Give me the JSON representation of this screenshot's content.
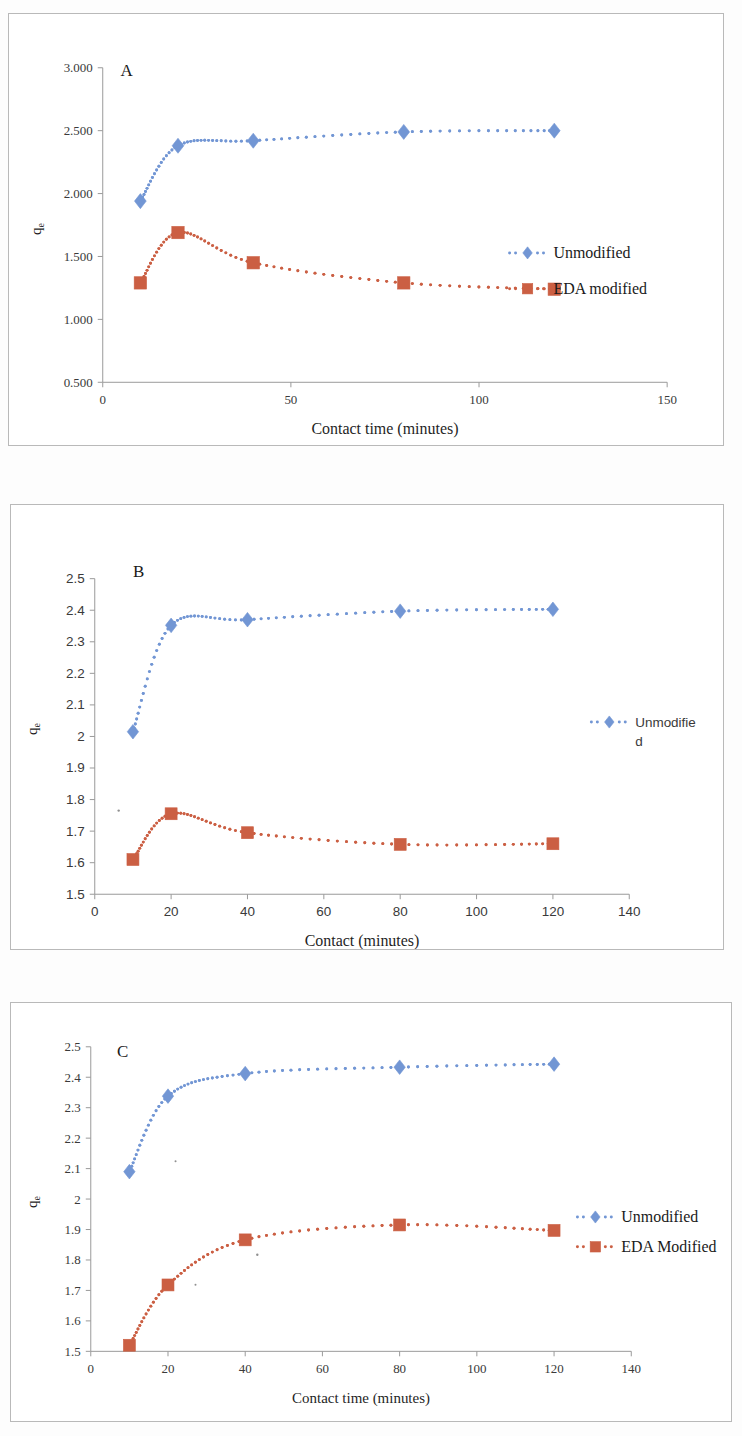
{
  "figure": {
    "background": "#ffffff",
    "series_colors": {
      "unmodified": "#7296d4",
      "eda": "#cb5f43"
    }
  },
  "panels": [
    {
      "id": "A",
      "letter": "A",
      "xlabel": "Contact time (minutes)",
      "ylabel_base": "q",
      "ylabel_sub": "e",
      "legend": [
        {
          "label": "Unmodified",
          "color": "#7296d4",
          "marker": "diamond"
        },
        {
          "label": "EDA modified",
          "color": "#cb5f43",
          "marker": "square"
        }
      ]
    },
    {
      "id": "B",
      "letter": "B",
      "xlabel": "Contact (minutes)",
      "ylabel_base": "q",
      "ylabel_sub": "e",
      "legend": [
        {
          "label": "Unmodifie",
          "label2": "d",
          "color": "#7296d4",
          "marker": "diamond"
        }
      ]
    },
    {
      "id": "C",
      "letter": "C",
      "xlabel": "Contact time (minutes)",
      "ylabel_base": "q",
      "ylabel_sub": "e",
      "legend": [
        {
          "label": "Unmodified",
          "color": "#7296d4",
          "marker": "diamond"
        },
        {
          "label": "EDA Modified",
          "color": "#cb5f43",
          "marker": "square"
        }
      ]
    }
  ],
  "chart_data": [
    {
      "type": "line",
      "panel": "A",
      "title": "A",
      "xlabel": "Contact time (minutes)",
      "ylabel": "qe",
      "xlim": [
        0,
        150
      ],
      "ylim": [
        0.5,
        3.0
      ],
      "xticks": [
        0,
        50,
        100,
        150
      ],
      "xticklabels": [
        "0",
        "50",
        "100",
        "150"
      ],
      "yticks": [
        0.5,
        1.0,
        1.5,
        2.0,
        2.5,
        3.0
      ],
      "yticklabels": [
        "0.500",
        "1.000",
        "1.500",
        "2.000",
        "2.500",
        "3.000"
      ],
      "grid": false,
      "legend_position": "right-middle",
      "linestyle": "dotted",
      "x": [
        10,
        20,
        40,
        80,
        120
      ],
      "series": [
        {
          "name": "Unmodified",
          "color": "#7296d4",
          "marker": "diamond",
          "values": [
            1.94,
            2.38,
            2.42,
            2.49,
            2.5
          ]
        },
        {
          "name": "EDA modified",
          "color": "#cb5f43",
          "marker": "square",
          "values": [
            1.29,
            1.69,
            1.45,
            1.29,
            1.24
          ]
        }
      ]
    },
    {
      "type": "line",
      "panel": "B",
      "title": "B",
      "xlabel": "Contact (minutes)",
      "ylabel": "qe",
      "xlim": [
        0,
        140
      ],
      "ylim": [
        1.5,
        2.5
      ],
      "xticks": [
        0,
        20,
        40,
        60,
        80,
        100,
        120,
        140
      ],
      "xticklabels": [
        "0",
        "20",
        "40",
        "60",
        "80",
        "100",
        "120",
        "140"
      ],
      "yticks": [
        1.5,
        1.6,
        1.7,
        1.8,
        1.9,
        2.0,
        2.1,
        2.2,
        2.3,
        2.4,
        2.5
      ],
      "yticklabels": [
        "1.5",
        "1.6",
        "1.7",
        "1.8",
        "1.9",
        "2",
        "2.1",
        "2.2",
        "2.3",
        "2.4",
        "2.5"
      ],
      "grid": false,
      "legend_position": "right-middle",
      "linestyle": "dotted",
      "x": [
        10,
        20,
        40,
        80,
        120
      ],
      "series": [
        {
          "name": "Unmodified",
          "color": "#7296d4",
          "marker": "diamond",
          "values": [
            2.015,
            2.352,
            2.37,
            2.397,
            2.403
          ]
        },
        {
          "name": "EDA modified",
          "color": "#cb5f43",
          "marker": "square",
          "values": [
            1.61,
            1.755,
            1.695,
            1.658,
            1.66
          ]
        }
      ]
    },
    {
      "type": "line",
      "panel": "C",
      "title": "C",
      "xlabel": "Contact time (minutes)",
      "ylabel": "qe",
      "xlim": [
        0,
        140
      ],
      "ylim": [
        1.5,
        2.5
      ],
      "xticks": [
        0,
        20,
        40,
        60,
        80,
        100,
        120,
        140
      ],
      "xticklabels": [
        "0",
        "20",
        "40",
        "60",
        "80",
        "100",
        "120",
        "140"
      ],
      "yticks": [
        1.5,
        1.6,
        1.7,
        1.8,
        1.9,
        2.0,
        2.1,
        2.2,
        2.3,
        2.4,
        2.5
      ],
      "yticklabels": [
        "1.5",
        "1.6",
        "1.7",
        "1.8",
        "1.9",
        "2",
        "2.1",
        "2.2",
        "2.3",
        "2.4",
        "2.5"
      ],
      "grid": false,
      "legend_position": "right-middle",
      "linestyle": "dotted",
      "x": [
        10,
        20,
        40,
        80,
        120
      ],
      "series": [
        {
          "name": "Unmodified",
          "color": "#7296d4",
          "marker": "diamond",
          "values": [
            2.09,
            2.338,
            2.412,
            2.433,
            2.443
          ]
        },
        {
          "name": "EDA Modified",
          "color": "#cb5f43",
          "marker": "square",
          "values": [
            1.52,
            1.718,
            1.866,
            1.915,
            1.897
          ]
        }
      ]
    }
  ]
}
